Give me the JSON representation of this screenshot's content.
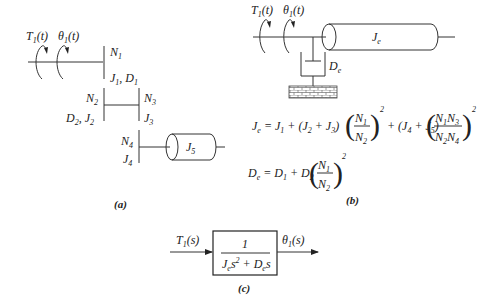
{
  "panel_a": {
    "caption": "(a)",
    "input_torque": "T1(t)",
    "input_angle": "θ1(t)",
    "gear1": {
      "teeth": "N1",
      "params": "J1, D1"
    },
    "gear2": {
      "teeth": "N2",
      "params": "D2, J2"
    },
    "gear3": {
      "teeth": "N3",
      "params": "J3"
    },
    "gear4": {
      "teeth": "N4",
      "params": "J4"
    },
    "load_inertia": "J5"
  },
  "panel_b": {
    "caption": "(b)",
    "input_torque": "T1(t)",
    "input_angle": "θ1(t)",
    "equivalent_inertia": "Je",
    "equivalent_damping": "De",
    "eq_je": "Je = J1 + (J2 + J3)(N1/N2)^2 + (J4 + J5)(N1N3/N2N4)^2",
    "eq_de": "De = D1 + D2(N1/N2)^2"
  },
  "panel_c": {
    "caption": "(c)",
    "input": "T1(s)",
    "output": "θ1(s)",
    "numerator": "1",
    "denominator": "Je s^2 + De s"
  }
}
